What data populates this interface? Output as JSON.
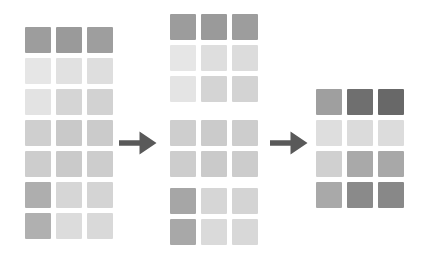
{
  "diagram": {
    "background_color": "#ffffff",
    "arrow_color": "#595959",
    "cell_size_px": 26,
    "cell_gap_px": 5,
    "stages": [
      {
        "id": "source",
        "name": "source-matrix",
        "rows": 7,
        "columns": 3,
        "colors": [
          [
            "#9d9d9d",
            "#9a9a9a",
            "#9e9e9e"
          ],
          [
            "#e6e6e6",
            "#e1e1e1",
            "#dedede"
          ],
          [
            "#e3e3e3",
            "#d5d5d5",
            "#d2d2d2"
          ],
          [
            "#cfcfcf",
            "#c9c9c9",
            "#cbcbcb"
          ],
          [
            "#cdcdcd",
            "#cacaca",
            "#cdcdcd"
          ],
          [
            "#aeaeae",
            "#d6d6d6",
            "#d4d4d4"
          ],
          [
            "#b0b0b0",
            "#dcdcdc",
            "#d9d9d9"
          ]
        ]
      },
      {
        "id": "split-group-0",
        "name": "split-group-top",
        "rows": 3,
        "columns": 3,
        "colors": [
          [
            "#9c9c9c",
            "#9a9a9a",
            "#9d9d9d"
          ],
          [
            "#e6e6e6",
            "#dedede",
            "#dcdcdc"
          ],
          [
            "#e4e4e4",
            "#d4d4d4",
            "#d3d3d3"
          ]
        ]
      },
      {
        "id": "split-group-1",
        "name": "split-group-middle",
        "rows": 2,
        "columns": 3,
        "colors": [
          [
            "#cecece",
            "#cbcbcb",
            "#cdcdcd"
          ],
          [
            "#cdcdcd",
            "#cacaca",
            "#cccccc"
          ]
        ]
      },
      {
        "id": "split-group-2",
        "name": "split-group-bottom",
        "rows": 2,
        "columns": 3,
        "colors": [
          [
            "#a6a6a6",
            "#d6d6d6",
            "#d4d4d4"
          ],
          [
            "#a8a8a8",
            "#dadada",
            "#d8d8d8"
          ]
        ]
      },
      {
        "id": "result",
        "name": "result-matrix",
        "rows": 4,
        "columns": 3,
        "colors": [
          [
            "#9f9f9f",
            "#6f6f6f",
            "#686868"
          ],
          [
            "#dedede",
            "#dbdbdb",
            "#dcdcdc"
          ],
          [
            "#d0d0d0",
            "#a9a9a9",
            "#a8a8a8"
          ],
          [
            "#a9a9a9",
            "#8a8a8a",
            "#888888"
          ]
        ]
      }
    ],
    "arrows": [
      {
        "id": "arrow-1",
        "name": "transform-arrow-1",
        "direction": "right"
      },
      {
        "id": "arrow-2",
        "name": "transform-arrow-2",
        "direction": "right"
      }
    ]
  }
}
